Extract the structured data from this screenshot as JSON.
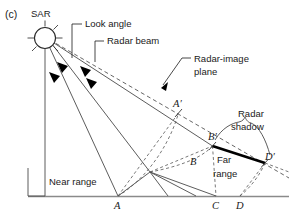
{
  "figure": {
    "panel_label": "(c)",
    "width": 291,
    "height": 214,
    "background": "#ffffff"
  },
  "labels": {
    "sar": "SAR",
    "look_angle": "Look angle",
    "radar_beam": "Radar beam",
    "radar_image_plane_line1": "Radar-image",
    "radar_image_plane_line2": "plane",
    "radar_shadow_line1": "Radar",
    "radar_shadow_line2": "shadow",
    "near_range": "Near range",
    "far_range_line1": "Far",
    "far_range_line2": "range"
  },
  "points": {
    "A": "A",
    "A_prime": "A′",
    "B": "B",
    "B_prime": "B′",
    "C": "C",
    "D": "D",
    "D_prime": "D′"
  },
  "colors": {
    "ink": "#1a1a1a",
    "solid": "#4a4a4a",
    "dashed": "#555555",
    "ground": "#8a8a8a",
    "shadow": "#000000",
    "background": "#ffffff"
  },
  "icons": {
    "sar_antenna": "sar-antenna-icon",
    "angle_arrow": "angle-arrowhead-icon",
    "leader_arrow": "leader-arrowhead-icon",
    "shadow_brace": "shadow-brace-icon"
  }
}
